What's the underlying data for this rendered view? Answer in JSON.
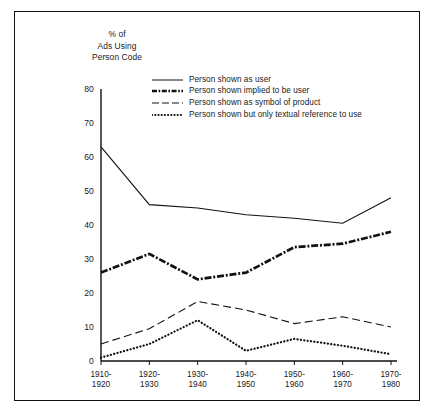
{
  "chart_data": {
    "type": "line",
    "title": "",
    "ylabel": "% of Ads Using Person Code",
    "xlabel": "",
    "ylim": [
      0,
      80
    ],
    "yticks": [
      0,
      10,
      20,
      30,
      40,
      50,
      60,
      70,
      80
    ],
    "grid": false,
    "legend_position": "top-center-inside",
    "categories": [
      "1910-1920",
      "1920-1930",
      "1930-1940",
      "1940-1950",
      "1950-1960",
      "1960-1970",
      "1970-1980"
    ],
    "category_lines": [
      [
        "1910-",
        "1920"
      ],
      [
        "1920-",
        "1930"
      ],
      [
        "1930-",
        "1940"
      ],
      [
        "1940-",
        "1950"
      ],
      [
        "1950-",
        "1960"
      ],
      [
        "1960-",
        "1970"
      ],
      [
        "1970-",
        "1980"
      ]
    ],
    "series": [
      {
        "name": "Person shown as user",
        "style": "solid",
        "values": [
          63,
          46,
          45,
          43,
          42,
          40.5,
          48
        ]
      },
      {
        "name": "Person shown implied to be user",
        "style": "dash-dot-thick",
        "values": [
          26,
          31.5,
          24,
          26,
          33.5,
          34.5,
          38
        ]
      },
      {
        "name": "Person shown as symbol of product",
        "style": "dashed",
        "values": [
          5,
          9.5,
          17.5,
          15,
          11,
          13,
          10
        ]
      },
      {
        "name": "Person shown but only textual reference to use",
        "style": "dotted",
        "values": [
          1,
          5,
          12,
          3,
          6.5,
          4.5,
          2
        ]
      }
    ]
  },
  "axis_title_lines": [
    "% of",
    "Ads Using",
    "Person Code"
  ]
}
